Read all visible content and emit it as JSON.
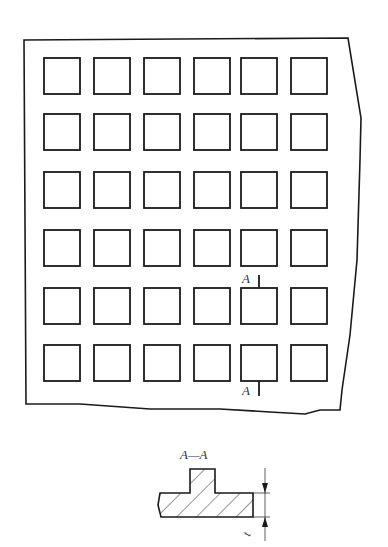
{
  "drawing": {
    "type": "technical-drawing",
    "plate": {
      "grid_rows": 6,
      "grid_cols": 6,
      "cell_x": [
        44,
        94,
        144,
        194,
        241,
        291
      ],
      "cell_y": [
        58,
        114,
        172,
        230,
        288,
        345
      ],
      "cell_size": 36
    },
    "section_marks": {
      "top_label": "A",
      "bottom_label": "A"
    },
    "section_view": {
      "title": "A—A",
      "dimension_label": "t"
    },
    "colors": {
      "line": "#1a1a1a",
      "background": "#ffffff"
    }
  }
}
